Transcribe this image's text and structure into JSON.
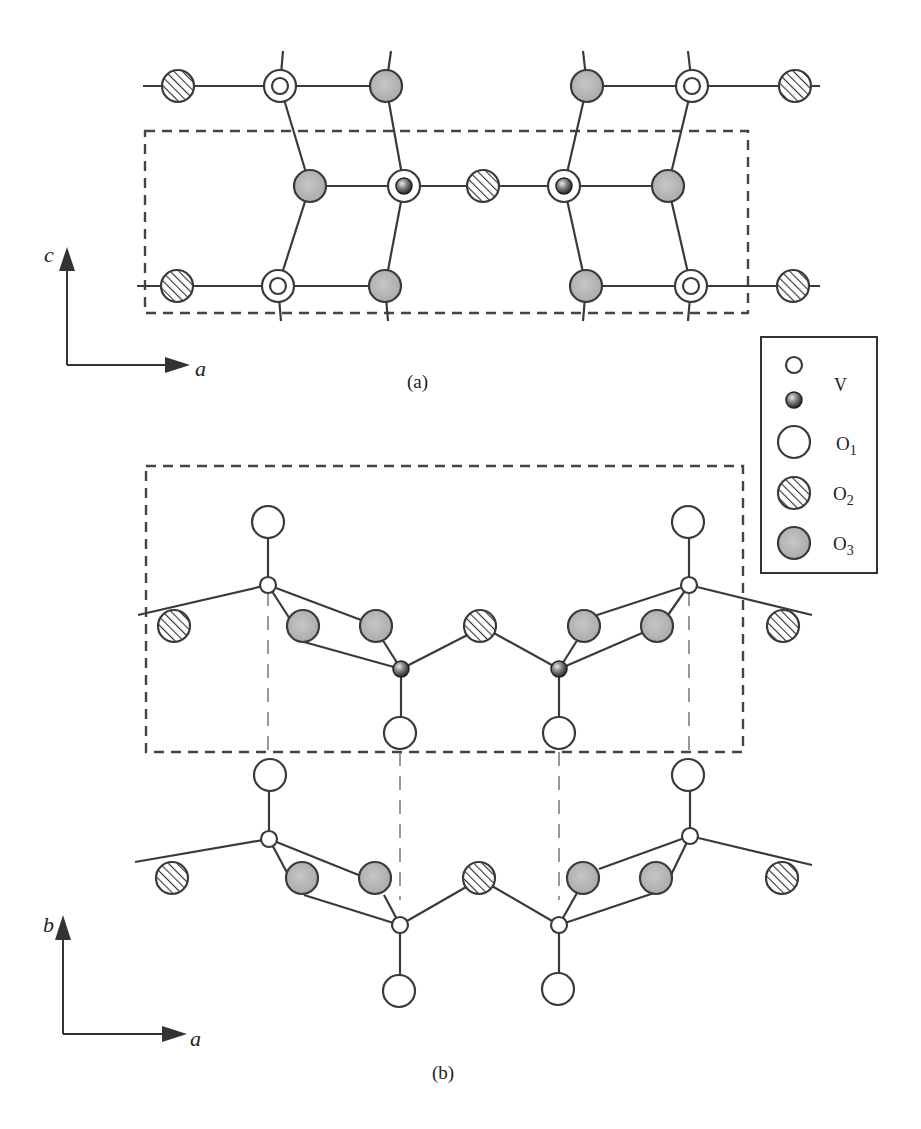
{
  "figure": {
    "panel_a": {
      "caption": "(a)",
      "axes": {
        "vertical": "c",
        "horizontal": "a"
      },
      "unit_cell": {
        "x": 145,
        "y": 131,
        "w": 603,
        "h": 182
      },
      "atoms": [
        {
          "type": "O2",
          "x": 178,
          "y": 86
        },
        {
          "type": "O1V",
          "x": 280,
          "y": 86
        },
        {
          "type": "O3",
          "x": 386,
          "y": 86
        },
        {
          "type": "O3",
          "x": 587,
          "y": 86
        },
        {
          "type": "O1V",
          "x": 692,
          "y": 86
        },
        {
          "type": "O2",
          "x": 795,
          "y": 86
        },
        {
          "type": "O3",
          "x": 310,
          "y": 186
        },
        {
          "type": "O1Vdark",
          "x": 404,
          "y": 186
        },
        {
          "type": "O2",
          "x": 483,
          "y": 186
        },
        {
          "type": "O1Vdark",
          "x": 564,
          "y": 186
        },
        {
          "type": "O3",
          "x": 668,
          "y": 186
        },
        {
          "type": "O2",
          "x": 177,
          "y": 286
        },
        {
          "type": "O1V",
          "x": 278,
          "y": 286
        },
        {
          "type": "O3",
          "x": 385,
          "y": 286
        },
        {
          "type": "O3",
          "x": 586,
          "y": 286
        },
        {
          "type": "O1V",
          "x": 691,
          "y": 286
        },
        {
          "type": "O2",
          "x": 793,
          "y": 286
        }
      ]
    },
    "panel_b": {
      "caption": "(b)",
      "axes": {
        "vertical": "b",
        "horizontal": "a"
      },
      "unit_cell": {
        "x": 146,
        "y": 466,
        "w": 597,
        "h": 286
      }
    },
    "legend": {
      "items": [
        {
          "symbol": "small-open-circle",
          "label": "V"
        },
        {
          "symbol": "small-dark-sphere",
          "label": ""
        },
        {
          "symbol": "large-open-circle",
          "label": "O",
          "sub": "1"
        },
        {
          "symbol": "hatched-circle",
          "label": "O",
          "sub": "2"
        },
        {
          "symbol": "gray-circle",
          "label": "O",
          "sub": "3"
        }
      ]
    },
    "colors": {
      "line": "#3a3a3a",
      "o3_fill": "#b8b8b8",
      "v_dark": "#2a2a2a",
      "background": "#ffffff"
    }
  }
}
